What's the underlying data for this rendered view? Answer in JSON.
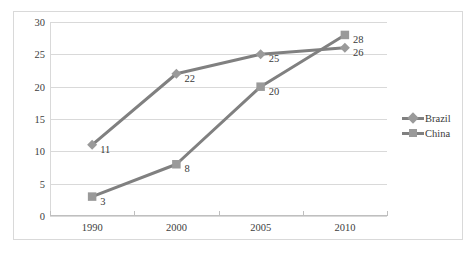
{
  "chart_data": {
    "type": "line",
    "title": "",
    "xlabel": "",
    "ylabel": "",
    "categories": [
      "1990",
      "2000",
      "2005",
      "2010"
    ],
    "ylim": [
      0,
      30
    ],
    "yticks": [
      0,
      5,
      10,
      15,
      20,
      25,
      30
    ],
    "grid": "horizontal",
    "legend_position": "right",
    "series": [
      {
        "name": "Brazil",
        "marker": "diamond",
        "color": "#808080",
        "values": [
          11,
          22,
          25,
          26
        ],
        "labels": [
          "11",
          "22",
          "25",
          "26"
        ]
      },
      {
        "name": "China",
        "marker": "square",
        "color": "#808080",
        "values": [
          3,
          8,
          20,
          28
        ],
        "labels": [
          "3",
          "8",
          "20",
          "28"
        ]
      }
    ]
  },
  "axis": {
    "ytick_labels": [
      "0",
      "5",
      "10",
      "15",
      "20",
      "25",
      "30"
    ],
    "xtick_labels": [
      "1990",
      "2000",
      "2005",
      "2010"
    ]
  },
  "legend": {
    "items": [
      {
        "label": "Brazil",
        "marker": "diamond"
      },
      {
        "label": "China",
        "marker": "square"
      }
    ]
  }
}
